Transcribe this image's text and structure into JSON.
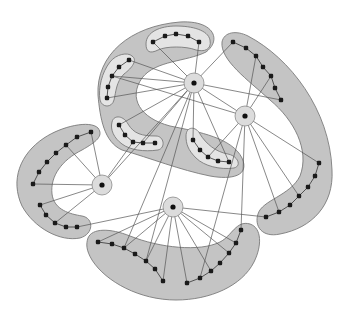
{
  "diagram": {
    "type": "clustered-graph",
    "width": 352,
    "height": 310,
    "colors": {
      "background": "#ffffff",
      "outer_region": "#c4c4c4",
      "inner_region": "#e4e4e4",
      "region_stroke": "#7a7a7a",
      "node": "#1a1a1a",
      "edge": "#555555",
      "hub_halo": "#dcdcdc"
    },
    "outer_regions": [
      {
        "id": "top-arc",
        "path": "M 98 95 C 96 55 130 26 180 22 C 214 20 222 40 206 52 C 186 62 156 60 142 78 C 128 98 140 118 170 126 C 200 132 232 138 242 158 C 250 176 232 180 210 176 C 180 170 150 158 122 150 C 104 142 100 118 98 95 Z"
      },
      {
        "id": "right-arc",
        "path": "M 222 42 C 224 32 236 30 248 36 C 290 58 330 110 332 170 C 334 205 312 228 280 234 C 262 238 254 226 258 214 C 262 200 290 196 300 176 C 310 150 294 120 270 100 C 248 80 220 60 222 42 Z"
      },
      {
        "id": "left-arc",
        "path": "M 98 128 C 104 136 96 142 82 150 C 62 160 50 176 52 194 C 54 210 70 214 82 216 C 94 218 94 234 80 238 C 60 242 34 228 22 206 C 10 180 20 154 44 138 C 62 126 90 120 98 128 Z"
      },
      {
        "id": "bottom-arc",
        "path": "M 88 238 C 92 228 110 228 130 236 C 160 248 200 252 220 242 C 232 236 236 220 250 224 C 262 228 262 246 254 262 C 242 286 210 300 176 300 C 140 300 106 282 92 260 C 86 250 86 244 88 238 Z"
      }
    ],
    "inner_regions": [
      {
        "id": "top-inner",
        "path": "M 146 44 C 146 32 160 26 176 26 C 192 26 208 30 210 40 C 212 50 204 52 196 50 C 186 46 166 46 158 50 C 150 54 146 52 146 44 Z"
      },
      {
        "id": "left-inner",
        "path": "M 132 56 C 138 60 132 68 124 74 C 116 82 116 92 114 100 C 112 108 102 108 100 100 C 98 88 102 72 110 62 C 116 54 128 52 132 56 Z"
      },
      {
        "id": "lower-left-inner",
        "path": "M 112 122 C 114 114 124 116 128 124 C 134 134 142 136 156 136 C 164 136 166 148 158 150 C 144 152 130 150 122 144 C 114 138 110 130 112 122 Z"
      },
      {
        "id": "right-inner",
        "path": "M 186 136 C 186 126 196 126 200 134 C 206 144 216 152 228 154 C 238 156 242 166 234 168 C 220 170 204 166 196 158 C 188 150 186 144 186 136 Z"
      }
    ],
    "hubs": [
      {
        "id": "A",
        "x": 194,
        "y": 83,
        "r": 10
      },
      {
        "id": "B",
        "x": 245,
        "y": 116,
        "r": 10
      },
      {
        "id": "C",
        "x": 102,
        "y": 185,
        "r": 10
      },
      {
        "id": "D",
        "x": 173,
        "y": 207,
        "r": 10
      }
    ],
    "chains": [
      {
        "id": "top-inner",
        "nodes": [
          [
            153,
            42
          ],
          [
            165,
            36
          ],
          [
            176,
            34
          ],
          [
            188,
            36
          ],
          [
            199,
            42
          ]
        ]
      },
      {
        "id": "left-inner",
        "nodes": [
          [
            129,
            60
          ],
          [
            119,
            67
          ],
          [
            112,
            76
          ],
          [
            108,
            87
          ],
          [
            107,
            98
          ]
        ]
      },
      {
        "id": "lower-left-inner",
        "nodes": [
          [
            119,
            125
          ],
          [
            125,
            135
          ],
          [
            133,
            142
          ],
          [
            143,
            143
          ],
          [
            155,
            143
          ]
        ]
      },
      {
        "id": "right-inner",
        "nodes": [
          [
            193,
            140
          ],
          [
            200,
            150
          ],
          [
            208,
            157
          ],
          [
            218,
            161
          ],
          [
            229,
            162
          ]
        ]
      },
      {
        "id": "top-right",
        "nodes": [
          [
            233,
            42
          ],
          [
            246,
            48
          ],
          [
            256,
            56
          ],
          [
            263,
            67
          ],
          [
            271,
            76
          ],
          [
            275,
            88
          ],
          [
            281,
            100
          ]
        ]
      },
      {
        "id": "right-lower",
        "nodes": [
          [
            319,
            163
          ],
          [
            315,
            176
          ],
          [
            308,
            187
          ],
          [
            299,
            196
          ],
          [
            290,
            205
          ],
          [
            279,
            212
          ],
          [
            266,
            217
          ]
        ]
      },
      {
        "id": "left-upper",
        "nodes": [
          [
            91,
            132
          ],
          [
            77,
            137
          ],
          [
            66,
            145
          ],
          [
            56,
            153
          ],
          [
            47,
            162
          ],
          [
            39,
            172
          ],
          [
            33,
            184
          ]
        ]
      },
      {
        "id": "left-lower",
        "nodes": [
          [
            40,
            205
          ],
          [
            46,
            215
          ],
          [
            55,
            223
          ],
          [
            66,
            227
          ],
          [
            77,
            227
          ]
        ]
      },
      {
        "id": "bottom-left",
        "nodes": [
          [
            98,
            242
          ],
          [
            112,
            244
          ],
          [
            124,
            248
          ],
          [
            135,
            254
          ],
          [
            146,
            261
          ],
          [
            155,
            269
          ],
          [
            163,
            281
          ]
        ]
      },
      {
        "id": "bottom-right",
        "nodes": [
          [
            187,
            283
          ],
          [
            200,
            278
          ],
          [
            211,
            271
          ],
          [
            220,
            263
          ],
          [
            229,
            253
          ],
          [
            236,
            243
          ],
          [
            241,
            230
          ]
        ]
      }
    ],
    "edges": [
      [
        194,
        83,
        153,
        42
      ],
      [
        194,
        83,
        199,
        42
      ],
      [
        194,
        83,
        129,
        60
      ],
      [
        194,
        83,
        112,
        76
      ],
      [
        194,
        83,
        107,
        98
      ],
      [
        194,
        83,
        119,
        125
      ],
      [
        194,
        83,
        193,
        140
      ],
      [
        194,
        83,
        233,
        42
      ],
      [
        194,
        83,
        281,
        100
      ],
      [
        194,
        83,
        245,
        116
      ],
      [
        194,
        83,
        143,
        143
      ],
      [
        194,
        83,
        229,
        162
      ],
      [
        194,
        83,
        146,
        261
      ],
      [
        194,
        83,
        124,
        248
      ],
      [
        245,
        116,
        112,
        76
      ],
      [
        245,
        116,
        256,
        56
      ],
      [
        245,
        116,
        271,
        76
      ],
      [
        245,
        116,
        208,
        157
      ],
      [
        245,
        116,
        319,
        163
      ],
      [
        245,
        116,
        299,
        196
      ],
      [
        245,
        116,
        279,
        212
      ],
      [
        245,
        116,
        241,
        230
      ],
      [
        245,
        116,
        200,
        278
      ],
      [
        102,
        185,
        91,
        132
      ],
      [
        102,
        185,
        66,
        145
      ],
      [
        102,
        185,
        33,
        184
      ],
      [
        102,
        185,
        40,
        205
      ],
      [
        102,
        185,
        55,
        223
      ],
      [
        102,
        185,
        133,
        142
      ],
      [
        102,
        185,
        194,
        83
      ],
      [
        173,
        207,
        77,
        227
      ],
      [
        173,
        207,
        98,
        242
      ],
      [
        173,
        207,
        124,
        248
      ],
      [
        173,
        207,
        146,
        261
      ],
      [
        173,
        207,
        163,
        281
      ],
      [
        173,
        207,
        187,
        283
      ],
      [
        173,
        207,
        211,
        271
      ],
      [
        173,
        207,
        229,
        253
      ],
      [
        173,
        207,
        236,
        243
      ],
      [
        173,
        207,
        266,
        217
      ]
    ]
  }
}
